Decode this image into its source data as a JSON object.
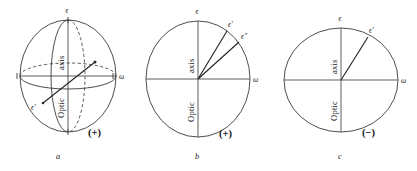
{
  "figure": {
    "stroke_color": "#3a3a3a",
    "ray_color": "#262626",
    "background": "#ffffff",
    "axis_label_line1": "Optic",
    "axis_label_line2": "axis"
  },
  "panels": [
    {
      "id": "a",
      "caption": "a",
      "sign": "(+)",
      "kind": "prolate-spheroid-3d",
      "axis_label_upper": "axis",
      "axis_label_lower": "Optic",
      "labels": {
        "top": "ϵ",
        "right": "ω",
        "lower_left": "ϵ'"
      }
    },
    {
      "id": "b",
      "caption": "b",
      "sign": "(+)",
      "kind": "prolate-ellipse-2d",
      "axis_label_upper": "axis",
      "axis_label_lower": "Optic",
      "labels": {
        "top": "ϵ",
        "right": "ω",
        "ray_1": "ϵ'",
        "ray_2": "ϵ''"
      }
    },
    {
      "id": "c",
      "caption": "c",
      "sign": "(−)",
      "kind": "oblate-ellipse-2d",
      "axis_label_upper": "axis",
      "axis_label_lower": "Optic",
      "labels": {
        "top": "ϵ",
        "right": "ω",
        "ray_1": "ϵ'"
      }
    }
  ]
}
